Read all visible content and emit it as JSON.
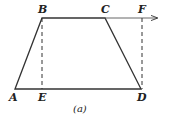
{
  "diagram": {
    "caption": "(a)",
    "colors": {
      "stroke": "#333333",
      "text": "#222222",
      "background": "#ffffff"
    },
    "points": {
      "A": {
        "label": "A",
        "x": 15,
        "y": 89
      },
      "B": {
        "label": "B",
        "x": 42,
        "y": 18
      },
      "C": {
        "label": "C",
        "x": 105,
        "y": 18
      },
      "D": {
        "label": "D",
        "x": 141,
        "y": 89
      },
      "E": {
        "label": "E",
        "x": 42,
        "y": 89
      },
      "F": {
        "label": "F",
        "x": 142,
        "y": 18
      }
    },
    "solid_edges": [
      "A-B",
      "B-C",
      "C-D",
      "D-A"
    ],
    "dashed_edges": [
      "B-E",
      "F-D"
    ],
    "arrow": {
      "from": "C",
      "to_x": 157,
      "y": 18
    }
  }
}
